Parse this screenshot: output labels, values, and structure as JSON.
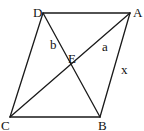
{
  "diagram": {
    "type": "rhombus-with-diagonals",
    "points": {
      "D": {
        "x": 43,
        "y": 13
      },
      "A": {
        "x": 130,
        "y": 13
      },
      "B": {
        "x": 100,
        "y": 117
      },
      "C": {
        "x": 10,
        "y": 117
      },
      "E": {
        "x": 71,
        "y": 67
      }
    },
    "vertex_labels": {
      "D": "D",
      "A": "A",
      "B": "B",
      "C": "C",
      "E": "E"
    },
    "segment_labels": {
      "b": "b",
      "a": "a",
      "x": "x"
    },
    "colors": {
      "stroke": "#1a1a1a",
      "text": "#111111",
      "background": "#ffffff"
    }
  }
}
